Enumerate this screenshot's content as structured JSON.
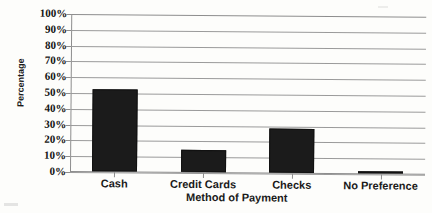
{
  "chart_data": {
    "type": "bar",
    "title": "",
    "subtitle": "",
    "xlabel": "Method of Payment",
    "ylabel": "Percentage",
    "categories": [
      "Cash",
      "Credit Cards",
      "Checks",
      "No Preference"
    ],
    "values": [
      52,
      14,
      28,
      1
    ],
    "series": [
      {
        "name": "Percentage",
        "values": [
          52,
          14,
          28,
          1
        ]
      }
    ],
    "ylim": [
      0,
      100
    ],
    "ytick_labels": [
      "100%",
      "90%",
      "80%",
      "70%",
      "60%",
      "50%",
      "40%",
      "30%",
      "20%",
      "10%",
      "0%"
    ],
    "ytick_values": [
      100,
      90,
      80,
      70,
      60,
      50,
      40,
      30,
      20,
      10,
      0
    ],
    "grid": true,
    "grid_axis": "y",
    "legend": false,
    "legend_position": "none",
    "bar_color": "#1b1b1b",
    "grid_color": "#9a9a9a",
    "axis_color": "#8d8d8d",
    "background_color": "#fdfdfb",
    "text_color": "#141414"
  },
  "axis": {
    "y_title": "Percentage",
    "x_title": "Method of Payment"
  },
  "yticks": [
    {
      "label": "100%",
      "value": 100
    },
    {
      "label": "90%",
      "value": 90
    },
    {
      "label": "80%",
      "value": 80
    },
    {
      "label": "70%",
      "value": 70
    },
    {
      "label": "60%",
      "value": 60
    },
    {
      "label": "50%",
      "value": 50
    },
    {
      "label": "40%",
      "value": 40
    },
    {
      "label": "30%",
      "value": 30
    },
    {
      "label": "20%",
      "value": 20
    },
    {
      "label": "10%",
      "value": 10
    },
    {
      "label": "0%",
      "value": 0
    }
  ],
  "bars": [
    {
      "label": "Cash",
      "value": 52
    },
    {
      "label": "Credit Cards",
      "value": 14
    },
    {
      "label": "Checks",
      "value": 28
    },
    {
      "label": "No Preference",
      "value": 1
    }
  ]
}
